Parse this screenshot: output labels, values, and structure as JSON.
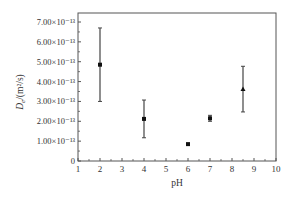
{
  "chart_data": {
    "type": "scatter",
    "title": "",
    "xlabel": "pH",
    "ylabel": "D_e/(m²/s)",
    "ylabel_parts": {
      "main": "D",
      "sub": "e",
      "unit": "/(m²/s)"
    },
    "xlim": [
      1,
      10
    ],
    "ylim": [
      0,
      7.5e-13
    ],
    "grid": false,
    "legend": null,
    "x_ticks": [
      1,
      2,
      3,
      4,
      5,
      6,
      7,
      8,
      9,
      10
    ],
    "x_tick_labels": [
      "1",
      "2",
      "3",
      "4",
      "5",
      "6",
      "7",
      "8",
      "9",
      "10"
    ],
    "y_ticks": [
      0,
      1e-13,
      2e-13,
      3e-13,
      4e-13,
      5e-13,
      6e-13,
      7e-13
    ],
    "y_tick_labels": [
      "0",
      "1.00×10⁻¹³",
      "2.00×10⁻¹³",
      "3.00×10⁻¹³",
      "4.00×10⁻¹³",
      "5.00×10⁻¹³",
      "6.00×10⁻¹³",
      "7.00×10⁻¹³"
    ],
    "series": [
      {
        "name": "De",
        "x": [
          2,
          4,
          6,
          7,
          8.5
        ],
        "y": [
          4.85e-13,
          2.12e-13,
          8.5e-14,
          2.15e-13,
          3.62e-13
        ],
        "error": [
          1.85e-13,
          9.5e-14,
          0.0,
          1.5e-14,
          1.15e-13
        ],
        "markers": [
          "square",
          "square",
          "square",
          "square",
          "triangle"
        ]
      }
    ]
  },
  "colors": {
    "axis": "#555555",
    "marker": "#111111",
    "errorbar": "#444444"
  }
}
